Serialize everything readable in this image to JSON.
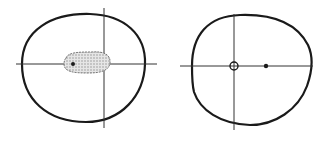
{
  "figure": {
    "panels": [
      {
        "id": "left",
        "description": "Elliptical boundary with crossed axes and a shaded region containing a point",
        "boundary": {
          "cx": 83,
          "cy": 67,
          "rx": 61,
          "ry": 54
        },
        "h_axis": {
          "x1": 16,
          "x2": 157,
          "y": 64
        },
        "v_axis": {
          "x": 104,
          "y1": 8,
          "y2": 128
        },
        "shaded_region": {
          "cx": 87,
          "cy": 63,
          "rx": 23,
          "ry": 11
        },
        "point": {
          "x": 73,
          "y": 64,
          "type": "filled"
        }
      },
      {
        "id": "right",
        "description": "Elliptical boundary with crossed axes, an open circle at the origin and a filled point on the horizontal axis",
        "boundary": {
          "cx": 252,
          "cy": 69,
          "rx": 60,
          "ry": 55
        },
        "h_axis": {
          "x1": 180,
          "x2": 313,
          "y": 66
        },
        "v_axis": {
          "x": 234,
          "y1": 14,
          "y2": 130
        },
        "open_circle": {
          "x": 234,
          "y": 66,
          "r": 4
        },
        "point": {
          "x": 266,
          "y": 66,
          "type": "filled"
        }
      }
    ],
    "colors": {
      "stroke": "#1a1a1a",
      "shade": "#b8b8b8",
      "background": "#ffffff"
    }
  }
}
